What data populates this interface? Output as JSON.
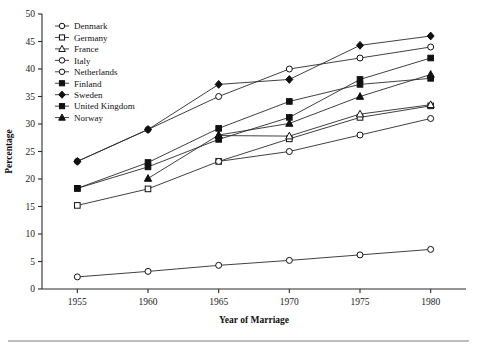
{
  "chart_data": {
    "type": "line",
    "title": "",
    "xlabel": "Year of Marriage",
    "ylabel": "Percentage",
    "x": [
      1955,
      1960,
      1965,
      1970,
      1975,
      1980
    ],
    "xlim": [
      1952.5,
      1982.5
    ],
    "ylim": [
      0,
      50
    ],
    "xticks": [
      "1955",
      "1960",
      "1965",
      "1970",
      "1975",
      "1980"
    ],
    "yticks": [
      "0",
      "5",
      "10",
      "15",
      "20",
      "25",
      "30",
      "35",
      "40",
      "45",
      "50"
    ],
    "grid": false,
    "legend_position": "upper-left",
    "series": [
      {
        "name": "Denmark",
        "marker": "open-circle",
        "x": [
          1955,
          1960,
          1965,
          1970,
          1975,
          1980
        ],
        "values": [
          23.2,
          29.0,
          35.0,
          40.0,
          42.0,
          44.0
        ]
      },
      {
        "name": "Germany",
        "marker": "open-square",
        "x": [
          1955,
          1960,
          1965,
          1970,
          1975,
          1980
        ],
        "values": [
          15.2,
          18.2,
          23.2,
          27.3,
          31.2,
          33.3
        ]
      },
      {
        "name": "France",
        "marker": "open-triangle",
        "x": [
          1965,
          1970,
          1975,
          1980
        ],
        "values": [
          27.9,
          27.8,
          31.8,
          33.5
        ]
      },
      {
        "name": "Italy",
        "marker": "open-circle",
        "x": [
          1955,
          1960,
          1965,
          1970,
          1975,
          1980
        ],
        "values": [
          2.2,
          3.2,
          4.3,
          5.2,
          6.2,
          7.2
        ]
      },
      {
        "name": "Netherlands",
        "marker": "open-circle",
        "x": [
          1965,
          1970,
          1975,
          1980
        ],
        "values": [
          23.2,
          25.0,
          28.0,
          31.0
        ]
      },
      {
        "name": "Finland",
        "marker": "filled-square",
        "x": [
          1955,
          1960,
          1965,
          1970,
          1975,
          1980
        ],
        "values": [
          18.3,
          23.0,
          29.2,
          34.1,
          37.2,
          38.3
        ]
      },
      {
        "name": "Sweden",
        "marker": "filled-diamond",
        "x": [
          1955,
          1960,
          1965,
          1970,
          1975,
          1980
        ],
        "values": [
          23.2,
          29.0,
          37.2,
          38.1,
          44.3,
          46.0
        ]
      },
      {
        "name": "United Kingdom",
        "marker": "filled-square",
        "x": [
          1955,
          1960,
          1965,
          1970,
          1975,
          1980
        ],
        "values": [
          18.3,
          22.2,
          27.2,
          31.2,
          38.1,
          42.0
        ]
      },
      {
        "name": "Norway",
        "marker": "filled-triangle",
        "x": [
          1960,
          1965,
          1970,
          1975,
          1980
        ],
        "values": [
          20.1,
          28.0,
          30.1,
          35.0,
          39.0
        ]
      }
    ]
  },
  "legend": {
    "items": [
      {
        "label": "Denmark"
      },
      {
        "label": "Germany"
      },
      {
        "label": "France"
      },
      {
        "label": "Italy"
      },
      {
        "label": "Netherlands"
      },
      {
        "label": "Finland"
      },
      {
        "label": "Sweden"
      },
      {
        "label": "United Kingdom"
      },
      {
        "label": "Norway"
      }
    ]
  },
  "colors": {
    "ink": "#1a1a1a",
    "line": "#2b2b2b",
    "marker_fill": "#111111",
    "marker_open": "#ffffff",
    "background": "#ffffff",
    "rule": "#6d6d6d"
  }
}
